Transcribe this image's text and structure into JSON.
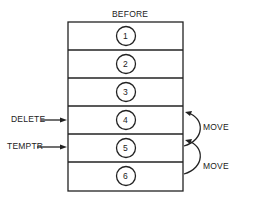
{
  "title": "BEFORE",
  "rows": [
    "1",
    "2",
    "3",
    "4",
    "5",
    "6"
  ],
  "pointers": [
    {
      "label": "DELETE",
      "row": 4
    },
    {
      "label": "TEMPTR",
      "row": 5
    }
  ],
  "moves": [
    {
      "label": "MOVE",
      "from": 5,
      "to": 4
    },
    {
      "label": "MOVE",
      "from": 6,
      "to": 5
    }
  ]
}
